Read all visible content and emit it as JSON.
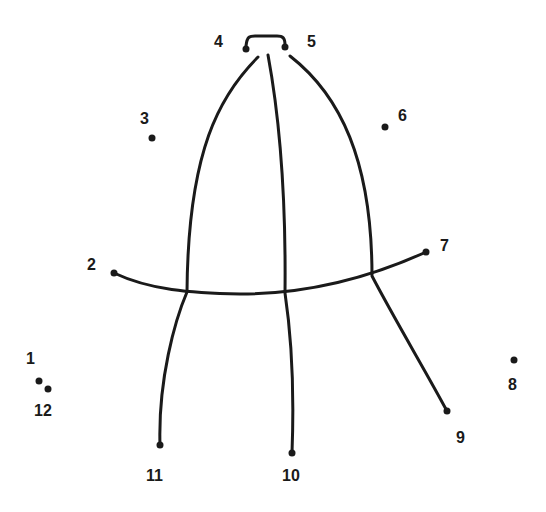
{
  "puzzle": {
    "type": "connect-the-dots",
    "colors": {
      "ink": "#1a1a1a",
      "background": "#ffffff"
    },
    "dots": [
      {
        "label": "1",
        "x": 39,
        "y": 381,
        "lx": 26,
        "ly": 364
      },
      {
        "label": "2",
        "x": 114,
        "y": 273,
        "lx": 87,
        "ly": 270
      },
      {
        "label": "3",
        "x": 152,
        "y": 138,
        "lx": 140,
        "ly": 124
      },
      {
        "label": "4",
        "x": 246,
        "y": 49,
        "lx": 214,
        "ly": 47
      },
      {
        "label": "5",
        "x": 285,
        "y": 47,
        "lx": 307,
        "ly": 47
      },
      {
        "label": "6",
        "x": 385,
        "y": 127,
        "lx": 398,
        "ly": 121
      },
      {
        "label": "7",
        "x": 426,
        "y": 252,
        "lx": 440,
        "ly": 251
      },
      {
        "label": "8",
        "x": 514,
        "y": 360,
        "lx": 508,
        "ly": 390
      },
      {
        "label": "9",
        "x": 447,
        "y": 411,
        "lx": 456,
        "ly": 443
      },
      {
        "label": "10",
        "x": 292,
        "y": 453,
        "lx": 282,
        "ly": 481
      },
      {
        "label": "11",
        "x": 160,
        "y": 445,
        "lx": 146,
        "ly": 481
      },
      {
        "label": "12",
        "x": 48,
        "y": 389,
        "lx": 34,
        "ly": 416
      }
    ]
  }
}
